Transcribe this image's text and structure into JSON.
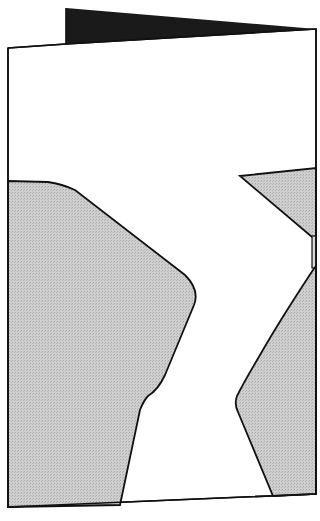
{
  "figure": {
    "colors": {
      "background": "#ffffff",
      "outline": "#111111",
      "back_flap": "#1a1a1a",
      "shaded_region": "#c8c8c8"
    }
  }
}
